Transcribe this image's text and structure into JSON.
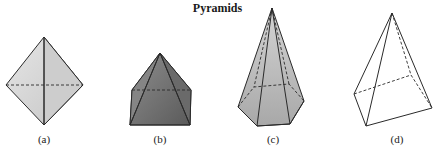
{
  "title": "Pyramids",
  "figures": [
    {
      "label": "(a)",
      "description": "square pyramid viewed edge-on (octahedral look)"
    },
    {
      "label": "(b)",
      "description": "square pyramid, dark shaded"
    },
    {
      "label": "(c)",
      "description": "hexagonal pyramid, tall"
    },
    {
      "label": "(d)",
      "description": "triangular/quadrilateral pyramid, unshaded wireframe"
    }
  ],
  "colors": {
    "edge": "#2a2a2a",
    "fill_a": "#d9d9d9",
    "fill_b": "#7a7a7a",
    "fill_c": "#b8b8b8",
    "fill_d": "#ffffff"
  }
}
